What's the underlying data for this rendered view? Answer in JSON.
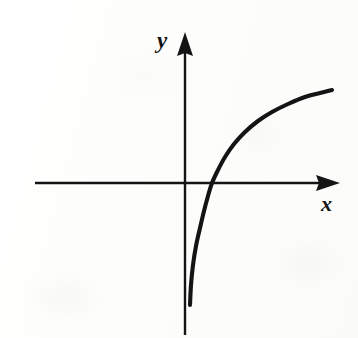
{
  "figure": {
    "kind": "cartesian-graph",
    "background_color": "#fdfdfc",
    "ink_color": "#141414",
    "y_axis_label": "y",
    "x_axis_label": "x"
  },
  "chart_data": {
    "type": "line",
    "title": "",
    "subtitle": "",
    "xlabel": "x",
    "ylabel": "y",
    "legend": [],
    "legend_position": "none",
    "grid": false,
    "axes": {
      "style": "arrowed-cartesian-axes",
      "origin_px": [
        185,
        183
      ],
      "x_axis": {
        "start_px": [
          35,
          183
        ],
        "end_px": [
          340,
          183
        ],
        "arrow_at": "end",
        "tick_labels": [],
        "label": "x"
      },
      "y_axis": {
        "start_px": [
          185,
          335
        ],
        "end_px": [
          185,
          32
        ],
        "arrow_at": "end",
        "tick_labels": [],
        "label": "y"
      },
      "xlim": [],
      "ylim": []
    },
    "series": [
      {
        "name": "logarithmic curve",
        "description": "increasing concave-down curve with vertical asymptote just right of the y-axis, rising through the x-axis and flattening to the right",
        "asymptote": "vertical",
        "x_intercept_px": [
          212,
          183
        ],
        "points_px": [
          [
            190,
            305
          ],
          [
            191,
            285
          ],
          [
            193,
            265
          ],
          [
            196,
            246
          ],
          [
            200,
            228
          ],
          [
            204,
            211
          ],
          [
            208,
            196
          ],
          [
            212,
            183
          ],
          [
            218,
            170
          ],
          [
            225,
            157
          ],
          [
            234,
            144
          ],
          [
            245,
            132
          ],
          [
            258,
            121
          ],
          [
            272,
            112
          ],
          [
            288,
            104
          ],
          [
            305,
            97
          ],
          [
            320,
            93
          ],
          [
            332,
            90
          ]
        ]
      }
    ]
  }
}
